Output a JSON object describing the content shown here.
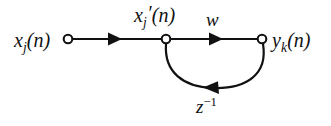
{
  "figure": {
    "type": "signal-flow-graph",
    "background_color": "#ffffff",
    "stroke_color": "#111111"
  },
  "labels": {
    "input": {
      "name": "input-signal-label",
      "base": "x",
      "subscript": "j",
      "argument": "(n)",
      "text": "x_j(n)"
    },
    "intermediate": {
      "name": "intermediate-signal-label",
      "base": "x",
      "subscript": "j",
      "prime": "′",
      "argument": "(n)",
      "text": "x_j′(n)"
    },
    "weight": {
      "name": "weight-label",
      "text": "w"
    },
    "output": {
      "name": "output-signal-label",
      "base": "y",
      "subscript": "k",
      "argument": "(n)",
      "text": "y_k(n)"
    },
    "delay": {
      "name": "unit-delay-operator-label",
      "base": "z",
      "superscript": "−1",
      "text": "z^-1"
    }
  },
  "nodes": [
    {
      "id": "input-node",
      "label": "x_j(n)",
      "x": 68,
      "y": 39,
      "radius": 4.5
    },
    {
      "id": "intermediate-node",
      "label": "x_j′(n)",
      "x": 166,
      "y": 39,
      "radius": 4.5
    },
    {
      "id": "output-node",
      "label": "y_k(n)",
      "x": 262,
      "y": 39,
      "radius": 4.5
    }
  ],
  "edges": [
    {
      "id": "input-edge",
      "from": "input-node",
      "to": "intermediate-node",
      "shape": "straight",
      "direction": "right",
      "arrow_at": {
        "x": 116,
        "y": 39
      },
      "weight_label": ""
    },
    {
      "id": "weight-edge",
      "from": "intermediate-node",
      "to": "output-node",
      "shape": "straight",
      "direction": "right",
      "arrow_at": {
        "x": 218,
        "y": 39
      },
      "weight_label": "w"
    },
    {
      "id": "feedback-edge",
      "from": "output-node",
      "to": "intermediate-node",
      "shape": "arc-below",
      "direction": "left",
      "arrow_at": {
        "x": 212,
        "y": 85
      },
      "weight_label": "z^-1"
    }
  ]
}
